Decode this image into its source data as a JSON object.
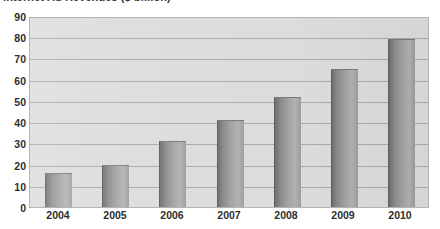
{
  "chart_data": {
    "type": "bar",
    "title": "Internet Ad Revenues ($ billion)",
    "xlabel": "",
    "ylabel": "",
    "categories": [
      "2004",
      "2005",
      "2006",
      "2007",
      "2008",
      "2009",
      "2010"
    ],
    "values": [
      16,
      20,
      31,
      41,
      52,
      65,
      79
    ],
    "ylim": [
      0,
      90
    ],
    "ytick_step": 10,
    "yticks": [
      "90",
      "80",
      "70",
      "60",
      "50",
      "40",
      "30",
      "20",
      "10",
      "0"
    ],
    "grid": true,
    "legend": "none",
    "series": [
      {
        "name": "Internet Ad Revenues",
        "values": [
          16,
          20,
          31,
          41,
          52,
          65,
          79
        ]
      }
    ],
    "colors": {
      "bar_fill": "#a2a2a2",
      "bar_edge": "#5d5d5d",
      "plot_background": "#dcdcdc",
      "gridline": "#a9a9a9",
      "text": "#2e2e2e"
    }
  }
}
